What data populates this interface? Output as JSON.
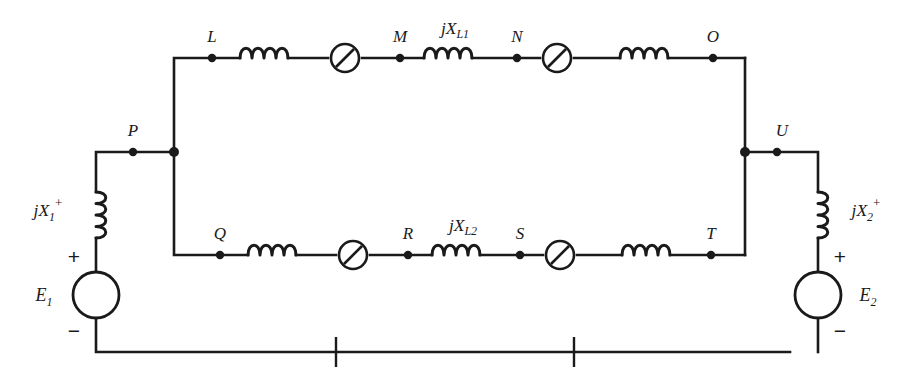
{
  "diagram": {
    "stroke_color": "#1a1a1a",
    "background_color": "#ffffff",
    "nodes": {
      "L": "L",
      "M": "M",
      "N": "N",
      "O": "O",
      "P": "P",
      "Q": "Q",
      "R": "R",
      "S": "S",
      "T": "T",
      "U": "U"
    },
    "reactance_labels": {
      "top_line": {
        "base": "jX",
        "sub": "L1"
      },
      "bottom_line": {
        "base": "jX",
        "sub": "L2"
      },
      "left_source": {
        "base": "jX",
        "sub": "1",
        "sup": "+"
      },
      "right_source": {
        "base": "jX",
        "sub": "2",
        "sup": "+"
      }
    },
    "sources": {
      "left": {
        "name": "E",
        "sub": "1",
        "plus": "+",
        "minus": "−"
      },
      "right": {
        "name": "E",
        "sub": "2",
        "plus": "+",
        "minus": "−"
      }
    },
    "icons": {
      "breaker": "circuit-breaker-icon",
      "inductor": "inductor-coil-icon",
      "source": "voltage-source-icon",
      "node": "junction-dot-icon",
      "tick": "reference-tick-icon"
    },
    "counts": {
      "breakers": 4,
      "line_inductors": 4,
      "source_inductors": 2,
      "junction_dots": 14,
      "bottom_ticks": 2
    }
  }
}
